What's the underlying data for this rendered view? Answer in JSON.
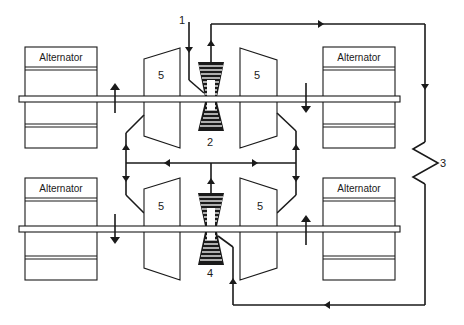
{
  "diagram": {
    "type": "schematic",
    "colors": {
      "ink": "#1a1a1a",
      "background": "#ffffff"
    },
    "alternators": [
      {
        "id": "alt-top-left",
        "label": "Alternator"
      },
      {
        "id": "alt-top-right",
        "label": "Alternator"
      },
      {
        "id": "alt-bottom-left",
        "label": "Alternator"
      },
      {
        "id": "alt-bottom-right",
        "label": "Alternator"
      }
    ],
    "turbines": [
      {
        "id": "turbine-top-left",
        "label": "5"
      },
      {
        "id": "turbine-top-right",
        "label": "5"
      },
      {
        "id": "turbine-bottom-left",
        "label": "5"
      },
      {
        "id": "turbine-bottom-right",
        "label": "5"
      }
    ],
    "callouts": {
      "inlet": "1",
      "compressor_top": "2",
      "cooler": "3",
      "compressor_bottom": "4"
    }
  }
}
